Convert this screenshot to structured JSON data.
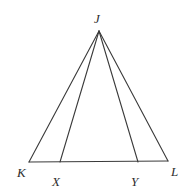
{
  "figure": {
    "kind": "geometry-diagram",
    "shape_name": "triangle",
    "canvas": {
      "width": 191,
      "height": 190
    },
    "background_color": "#ffffff",
    "stroke_color": "#3a3a3a",
    "label_color": "#2e2e2e",
    "stroke_width": 1.1,
    "points": {
      "J": {
        "label": "J",
        "x": 99,
        "y": 31
      },
      "K": {
        "label": "K",
        "x": 29,
        "y": 162
      },
      "X": {
        "label": "X",
        "x": 60,
        "y": 162
      },
      "Y": {
        "label": "Y",
        "x": 138,
        "y": 162
      },
      "L": {
        "label": "L",
        "x": 168,
        "y": 161
      }
    },
    "segments": [
      {
        "name": "JK",
        "from": "J",
        "to": "K"
      },
      {
        "name": "JX",
        "from": "J",
        "to": "X"
      },
      {
        "name": "JY",
        "from": "J",
        "to": "Y"
      },
      {
        "name": "JL",
        "from": "J",
        "to": "L"
      },
      {
        "name": "KL",
        "from": "K",
        "to": "L"
      }
    ],
    "label_offsets": {
      "J": {
        "dx": -5,
        "dy": -19
      },
      "K": {
        "dx": -12,
        "dy": 4
      },
      "X": {
        "dx": -8,
        "dy": 13
      },
      "Y": {
        "dx": -7,
        "dy": 13
      },
      "L": {
        "dx": 3,
        "dy": 4
      }
    }
  }
}
